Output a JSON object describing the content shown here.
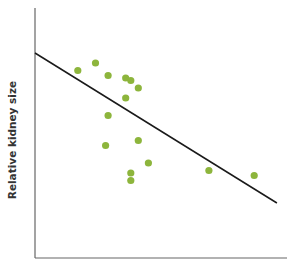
{
  "chart_data": {
    "type": "scatter",
    "title": "",
    "xlabel": "",
    "ylabel": "Relative kidney size",
    "grid": false,
    "legend": null,
    "note": "Positions are pixel-estimated; axes have no tick labels. Values normalized to 0-100 on each axis.",
    "xlim": [
      0,
      100
    ],
    "ylim": [
      0,
      100
    ],
    "points": [
      {
        "x": 17,
        "y": 75
      },
      {
        "x": 24,
        "y": 78
      },
      {
        "x": 29,
        "y": 73
      },
      {
        "x": 36,
        "y": 72
      },
      {
        "x": 38,
        "y": 71
      },
      {
        "x": 41,
        "y": 68
      },
      {
        "x": 36,
        "y": 64
      },
      {
        "x": 29,
        "y": 57
      },
      {
        "x": 28,
        "y": 45
      },
      {
        "x": 41,
        "y": 47
      },
      {
        "x": 45,
        "y": 38
      },
      {
        "x": 38,
        "y": 34
      },
      {
        "x": 38,
        "y": 31
      },
      {
        "x": 69,
        "y": 35
      },
      {
        "x": 87,
        "y": 33
      }
    ],
    "trendline": {
      "x": [
        0,
        96
      ],
      "y": [
        82,
        22
      ],
      "color": "#1a1a1a"
    },
    "point_color": "#8db53c"
  },
  "colors": {
    "point": "#8db53c",
    "line": "#1a1a1a",
    "axis": "#555555"
  }
}
